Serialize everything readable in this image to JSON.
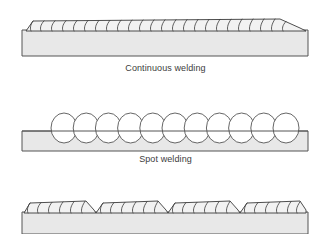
{
  "figure": {
    "background_color": "#ffffff",
    "width": 331,
    "height": 234
  },
  "style": {
    "plate_fill": "#e8e8e8",
    "plate_stroke": "#555555",
    "bead_fill": "#f2f2f2",
    "bead_stroke": "#3a3a3a",
    "ripple_stroke": "#3a3a3a",
    "spot_fill": "#ffffff",
    "spot_stroke": "#555555",
    "caption_color": "#3c3c3c"
  },
  "panels": [
    {
      "id": "continuous",
      "name": "continuous-welding",
      "caption": "Continuous welding",
      "weld_type": "continuous",
      "plate": {
        "x": 22,
        "y": 30,
        "width": 286,
        "height": 26
      },
      "bead": {
        "x_start": 26,
        "x_end": 306,
        "top_y": 19,
        "base_y": 31,
        "ripple_count": 24,
        "description": "Unbroken weld bead running the full length of the plate with evenly spaced overlapping crescent ripples"
      }
    },
    {
      "id": "spot",
      "name": "spot-welding",
      "caption": "Spot welding",
      "weld_type": "spot",
      "plate": {
        "x": 22,
        "y": 131,
        "width": 286,
        "height": 20
      },
      "spots": {
        "count": 11,
        "first_center_x": 64,
        "spacing": 22.2,
        "center_y": 128,
        "radius_x": 13,
        "radius_y": 15,
        "description": "Row of eleven discrete oval weld nuggets sitting along the top edge of the plate"
      }
    },
    {
      "id": "intermittent",
      "name": "intermittent-welding",
      "caption": "",
      "weld_type": "intermittent",
      "plate": {
        "x": 22,
        "y": 212,
        "width": 286,
        "height": 22
      },
      "bead": {
        "x_start": 24,
        "x_end": 306,
        "top_y": 201,
        "base_y": 213,
        "segment_count": 4,
        "ripples_per_segment": 6,
        "description": "Four separate stitch weld segments with short unwelded gaps between them, bottom of figure cropped"
      }
    }
  ]
}
